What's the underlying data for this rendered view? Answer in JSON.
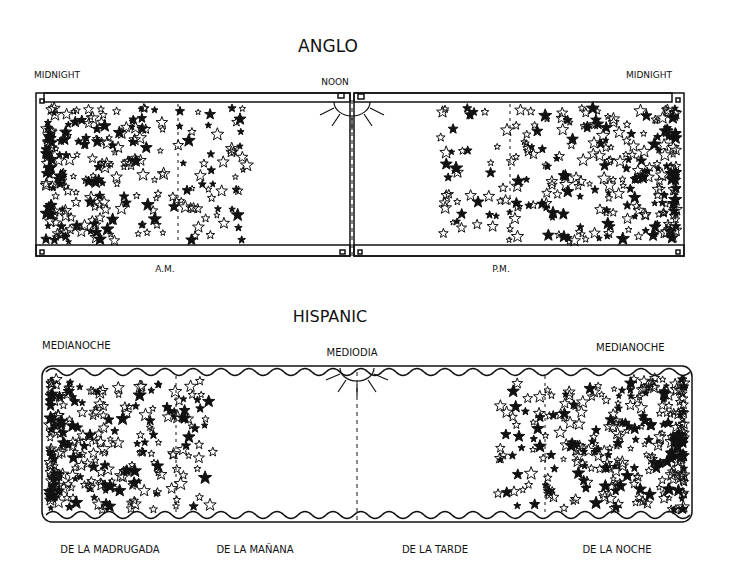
{
  "anglo": {
    "title": "ANGLO",
    "left_label": "MIDNIGHT",
    "center_label": "NOON",
    "right_label": "MIDNIGHT",
    "bottom_left_label": "A.M.",
    "bottom_right_label": "P.M."
  },
  "hispanic": {
    "title": "HISPANIC",
    "left_label": "MEDIANOCHE",
    "center_label": "MEDIODIA",
    "right_label": "MEDIANOCHE",
    "period_labels": [
      "DE LA MADRUGADA",
      "DE LA MAÑANA",
      "DE LA TARDE",
      "DE LA NOCHE"
    ]
  },
  "colors": {
    "ink": "#111111",
    "paper": "#ffffff"
  }
}
